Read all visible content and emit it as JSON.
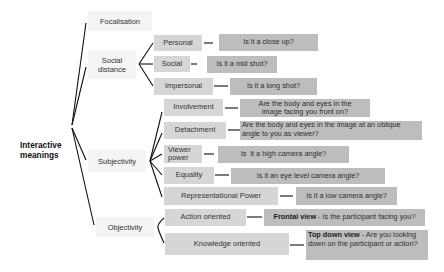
{
  "root": {
    "label_line1": "Interactive",
    "label_line2": "meanings"
  },
  "categories": [
    {
      "label": "Focalisation"
    },
    {
      "label_line1": "Social",
      "label_line2": "distance"
    },
    {
      "label": "Subjectivity"
    },
    {
      "label": "Objectivity"
    }
  ],
  "social_distance": [
    {
      "label": "Personal",
      "question": "Is it a close up?"
    },
    {
      "label": "Social",
      "question": "Is it a mid shot?"
    },
    {
      "label": "Impersonal",
      "question": "Is it a long shot?"
    }
  ],
  "subjectivity": [
    {
      "label": "Involvement",
      "question_line1": "Are the body and eyes in the",
      "question_line2": "image facing you front on?"
    },
    {
      "label": "Detachment",
      "question_line1": "Are the body and eyes in the image at an oblique",
      "question_line2": "angle to you as viewer?"
    },
    {
      "label_line1": "Viewer",
      "label_line2": "power",
      "question": "Is  it a high camera angle?"
    },
    {
      "label": "Equality",
      "question": "Is it an eye level camera angle?"
    },
    {
      "label": "Representational Power",
      "question": "Is it a low camera angle?"
    }
  ],
  "objectivity": [
    {
      "label": "Action oriented",
      "question_bold": "Frontal view",
      "question_rest": " - Is the participant facing you?"
    },
    {
      "label": "Knowledge oriented",
      "question_bold": "Top down view",
      "question_rest": " - Are you looking down on the participant or action?"
    }
  ],
  "colors": {
    "category_bg": "#f4f4f4",
    "sub_bg": "#d6d6d6",
    "question_bg": "#bdbdbd",
    "line": "#111111"
  }
}
